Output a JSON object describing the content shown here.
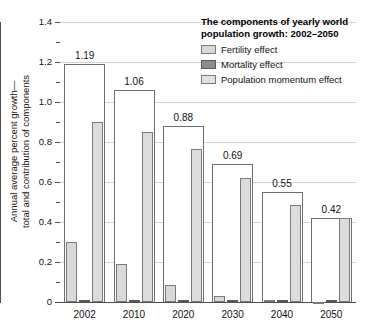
{
  "chart_data": {
    "type": "bar",
    "title": "The components of yearly world population growth: 2002–2050",
    "title_line1": "The components of yearly world",
    "title_line2": "population growth: 2002–2050",
    "xlabel": "",
    "ylabel_line1": "Annual average percent growth—",
    "ylabel_line2": "total and contribution of components",
    "categories": [
      "2002",
      "2010",
      "2020",
      "2030",
      "2040",
      "2050"
    ],
    "ylim": [
      0,
      1.4
    ],
    "ytick_labels": [
      "0",
      "0.2",
      "0.4",
      "0.6",
      "0.8",
      "1.0",
      "1.2",
      "1.4"
    ],
    "ytick_values": [
      0,
      0.2,
      0.4,
      0.6,
      0.8,
      1.0,
      1.2,
      1.4
    ],
    "grid": true,
    "legend_position": "top-right",
    "total_labels": [
      "1.19",
      "1.06",
      "0.88",
      "0.69",
      "0.55",
      "0.42"
    ],
    "totals": [
      1.19,
      1.06,
      0.88,
      0.69,
      0.55,
      0.42
    ],
    "series": [
      {
        "name": "Fertility effect",
        "color": "#d9d9d9",
        "values": [
          0.3,
          0.19,
          0.085,
          0.03,
          0.012,
          -0.005
        ]
      },
      {
        "name": "Mortality effect",
        "color": "#8c8c8c",
        "values": [
          0.005,
          0.005,
          0.005,
          0.005,
          0.006,
          0.005
        ]
      },
      {
        "name": "Population momentum effect",
        "color": "#dcdcdc",
        "values": [
          0.9,
          0.85,
          0.765,
          0.62,
          0.485,
          0.42
        ]
      }
    ],
    "legend_entries": [
      "Fertility effect",
      "Mortality effect",
      "Population momentum effect"
    ],
    "colors": {
      "fertility": "#d9d9d9",
      "mortality": "#8c8c8c",
      "momentum": "#dcdcdc",
      "total_outline": "#6e6e6e",
      "grid": "#d2d2d2",
      "axis": "#4d4d4d",
      "background": "#ffffff"
    }
  }
}
